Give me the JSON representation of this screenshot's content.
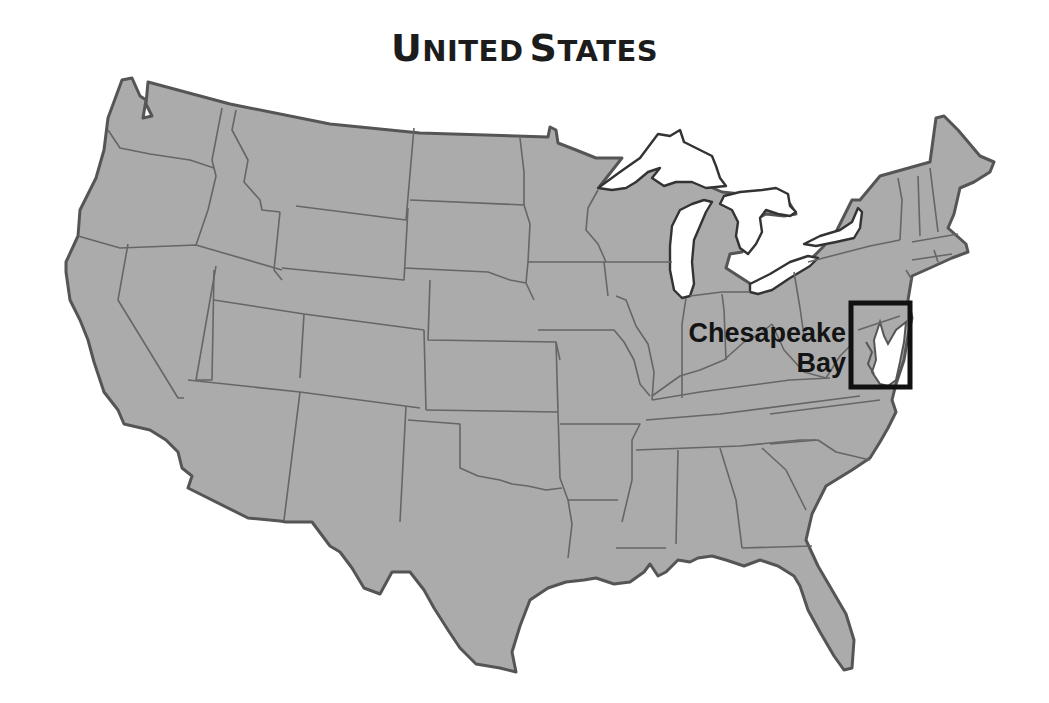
{
  "map": {
    "title": "United States",
    "title_display": {
      "first_initial": "U",
      "first_rest": "NITED",
      "second_initial": "S",
      "second_rest": "TATES"
    },
    "colors": {
      "land": "#ababab",
      "coast_outline": "#555555",
      "state_border": "#666666",
      "water": "#ffffff",
      "highlight_box": "#111111",
      "label_text": "#141414"
    },
    "highlight": {
      "label_line1": "Chesapeake",
      "label_line2": "Bay",
      "region": "Chesapeake Bay"
    },
    "features": [
      "Great Lakes",
      "state borders",
      "Chesapeake Bay inset box"
    ]
  }
}
